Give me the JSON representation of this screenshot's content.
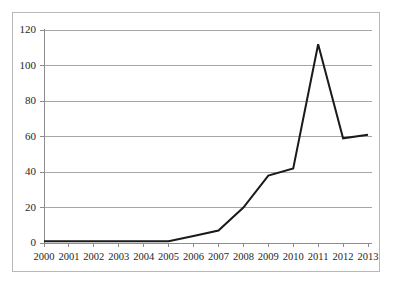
{
  "chart_data": {
    "type": "line",
    "title": "",
    "subtitle": "",
    "xlabel": "",
    "ylabel": "",
    "categories": [
      "2000",
      "2001",
      "2002",
      "2003",
      "2004",
      "2005",
      "2006",
      "2007",
      "2008",
      "2009",
      "2010",
      "2011",
      "2012",
      "2013"
    ],
    "series": [
      {
        "name": "",
        "values": [
          1,
          1,
          1,
          1,
          1,
          1,
          4,
          7,
          20,
          38,
          42,
          112,
          59,
          61
        ],
        "color": "#1a1a1a",
        "line_width": 2,
        "markers": false
      }
    ],
    "ylim": [
      0,
      120
    ],
    "ytick_values": [
      0,
      20,
      40,
      60,
      80,
      100,
      120
    ],
    "ytick_labels": [
      "0",
      "20",
      "40",
      "60",
      "80",
      "100",
      "120"
    ],
    "xtick_labels": [
      "2000",
      "2001",
      "2002",
      "2003",
      "2004",
      "2005",
      "2006",
      "2007",
      "2008",
      "2009",
      "2010",
      "2011",
      "2012",
      "2013"
    ],
    "grid": {
      "horizontal": true,
      "vertical": false,
      "color": "#a6a6a6"
    },
    "legend": {
      "visible": false,
      "position": "none",
      "entries": []
    },
    "axis": {
      "color": "#8c8c8c",
      "tick_color": "#8c8c8c"
    },
    "frame": {
      "border_color": "#b9b9b9",
      "background": "#ffffff"
    }
  }
}
